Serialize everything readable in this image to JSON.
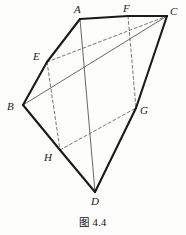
{
  "figure": {
    "caption": "图 4.4",
    "background_color": "#fdfdfc",
    "stroke_color": "#1a1a1a",
    "thin_stroke_color": "#555555",
    "dashed_stroke_color": "#666666",
    "vertices": [
      {
        "label": "A",
        "x": 80,
        "y": 19,
        "label_x": 74,
        "label_y": 4
      },
      {
        "label": "F",
        "x": 128,
        "y": 16,
        "label_x": 123,
        "label_y": 3
      },
      {
        "label": "C",
        "x": 167,
        "y": 16,
        "label_x": 170,
        "label_y": 6
      },
      {
        "label": "E",
        "x": 47,
        "y": 62,
        "label_x": 33,
        "label_y": 51
      },
      {
        "label": "B",
        "x": 23,
        "y": 105,
        "label_x": 7,
        "label_y": 101
      },
      {
        "label": "G",
        "x": 136,
        "y": 108,
        "label_x": 140,
        "label_y": 105
      },
      {
        "label": "H",
        "x": 60,
        "y": 150,
        "label_x": 44,
        "label_y": 152
      },
      {
        "label": "D",
        "x": 95,
        "y": 192,
        "label_x": 91,
        "label_y": 196
      }
    ],
    "solid_edges": [
      {
        "name": "edge-A-F",
        "from": "A",
        "to": "F"
      },
      {
        "name": "edge-F-C",
        "from": "F",
        "to": "C"
      },
      {
        "name": "edge-A-E",
        "from": "A",
        "to": "E"
      },
      {
        "name": "edge-E-B",
        "from": "E",
        "to": "B"
      },
      {
        "name": "edge-B-H",
        "from": "B",
        "to": "H"
      },
      {
        "name": "edge-H-D",
        "from": "H",
        "to": "D"
      },
      {
        "name": "edge-C-G",
        "from": "C",
        "to": "G"
      },
      {
        "name": "edge-G-D",
        "from": "G",
        "to": "D"
      }
    ],
    "thin_edges": [
      {
        "name": "edge-B-C",
        "from": "B",
        "to": "C"
      },
      {
        "name": "edge-A-D",
        "from": "A",
        "to": "D"
      }
    ],
    "dashed_edges": [
      {
        "name": "edge-E-C",
        "from": "E",
        "to": "C"
      },
      {
        "name": "edge-E-H",
        "from": "E",
        "to": "H"
      },
      {
        "name": "edge-F-G",
        "from": "F",
        "to": "G"
      },
      {
        "name": "edge-H-G",
        "from": "H",
        "to": "G"
      }
    ]
  }
}
